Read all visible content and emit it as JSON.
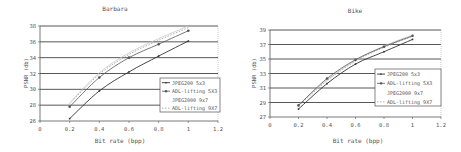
{
  "chart_data": [
    {
      "type": "line",
      "title": "Barbara",
      "xlabel": "Bit rate (bpp)",
      "ylabel": "PSNR (db)",
      "xlim": [
        0,
        1.2
      ],
      "ylim": [
        26,
        38
      ],
      "xticks": [
        "0",
        "0.2",
        "0.4",
        "0.6",
        "0.8",
        "1",
        "1.2"
      ],
      "yticks": [
        "26",
        "28",
        "30",
        "32",
        "34",
        "36",
        "38"
      ],
      "grid": "horizontal",
      "legend_position": "lower right inside",
      "x": [
        0.2,
        0.4,
        0.6,
        0.8,
        1.0
      ],
      "series": [
        {
          "name": "JPEG200 5x3",
          "values": [
            26.3,
            29.8,
            32.2,
            34.2,
            36.1
          ],
          "style": "solid",
          "marker": "dash"
        },
        {
          "name": "ADL-lifting 5X3",
          "values": [
            27.8,
            31.5,
            34.0,
            35.7,
            37.4
          ],
          "style": "solid-light",
          "marker": "star"
        },
        {
          "name": "JPEG2000 9x7",
          "values": [
            28.3,
            32.1,
            34.6,
            36.4,
            38.0
          ],
          "style": "very-light",
          "marker": "none"
        },
        {
          "name": "ADL-lifting 9X7",
          "values": [
            28.2,
            31.9,
            34.4,
            36.2,
            37.8
          ],
          "style": "dotted",
          "marker": "none"
        }
      ]
    },
    {
      "type": "line",
      "title": "Bike",
      "xlabel": "Bit rate (bpp)",
      "ylabel": "PSNR (db)",
      "xlim": [
        0,
        1.2
      ],
      "ylim": [
        27,
        39
      ],
      "xticks": [
        "0",
        "0.2",
        "0.4",
        "0.6",
        "0.8",
        "1",
        "1.2"
      ],
      "yticks": [
        "27",
        "29",
        "31",
        "33",
        "35",
        "37",
        "39"
      ],
      "grid": "horizontal",
      "legend_position": "lower right inside",
      "x": [
        0.2,
        0.4,
        0.6,
        0.8,
        1.0
      ],
      "series": [
        {
          "name": "JPEG200 5x3",
          "values": [
            28.1,
            31.6,
            34.3,
            36.0,
            37.7
          ],
          "style": "solid",
          "marker": "dash"
        },
        {
          "name": "ADL-lifting 5X3",
          "values": [
            28.6,
            32.3,
            34.9,
            36.7,
            38.2
          ],
          "style": "solid-light",
          "marker": "star"
        },
        {
          "name": "JPEG2000 9x7",
          "values": [
            28.7,
            32.1,
            34.8,
            36.8,
            38.3
          ],
          "style": "very-light",
          "marker": "none"
        },
        {
          "name": "ADL-lifting 9X7",
          "values": [
            28.5,
            32.0,
            34.7,
            36.6,
            38.1
          ],
          "style": "dotted",
          "marker": "none"
        }
      ]
    }
  ],
  "colors": {
    "axis": "#555555",
    "grid": "#444444",
    "series": [
      "#333333",
      "#555555",
      "#c8c8c8",
      "#999999"
    ]
  }
}
